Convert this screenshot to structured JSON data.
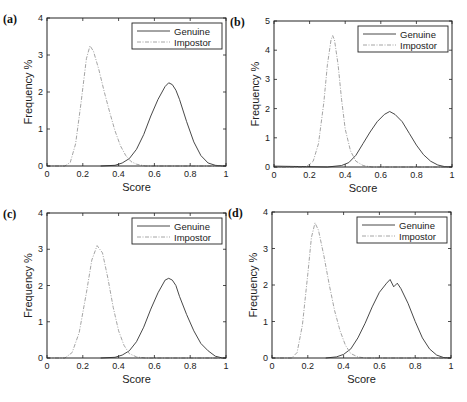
{
  "figure": {
    "shared": {
      "xlabel": "Score",
      "ylabel": "Frequency %",
      "xticks": [
        "0",
        "0.2",
        "0.4",
        "0.6",
        "0.8",
        "1"
      ],
      "legend": [
        "Genuine",
        "Impostor"
      ],
      "colors": {
        "genuine": "#333333",
        "impostor": "#9a9a9a",
        "axis": "#222222"
      }
    }
  },
  "chart_data": [
    {
      "panel": "(a)",
      "type": "line",
      "xlabel": "Score",
      "ylabel": "Frequency %",
      "xlim": [
        0,
        1
      ],
      "ylim": [
        0,
        4
      ],
      "yticks": [
        "0",
        "1",
        "2",
        "3",
        "4"
      ],
      "legend_position": "upper right",
      "series": [
        {
          "name": "Genuine",
          "style": "solid",
          "x": [
            0.3,
            0.38,
            0.42,
            0.46,
            0.5,
            0.54,
            0.58,
            0.62,
            0.66,
            0.68,
            0.7,
            0.72,
            0.74,
            0.78,
            0.82,
            0.86,
            0.9,
            0.94,
            0.98,
            1.0
          ],
          "y": [
            0.0,
            0.02,
            0.08,
            0.2,
            0.45,
            0.85,
            1.35,
            1.8,
            2.15,
            2.25,
            2.2,
            2.05,
            1.8,
            1.2,
            0.65,
            0.28,
            0.08,
            0.02,
            0.0,
            0.0
          ]
        },
        {
          "name": "Impostor",
          "style": "dash-dot",
          "x": [
            0.0,
            0.1,
            0.13,
            0.16,
            0.19,
            0.22,
            0.24,
            0.26,
            0.29,
            0.32,
            0.35,
            0.38,
            0.41,
            0.44,
            0.47,
            0.5,
            0.55,
            0.6,
            1.0
          ],
          "y": [
            0.0,
            0.0,
            0.1,
            0.6,
            1.7,
            2.9,
            3.25,
            3.1,
            2.6,
            2.0,
            1.45,
            0.95,
            0.55,
            0.28,
            0.12,
            0.05,
            0.0,
            0.0,
            0.0
          ]
        }
      ]
    },
    {
      "panel": "(b)",
      "type": "line",
      "xlabel": "Score",
      "ylabel": "Frequency %",
      "xlim": [
        0,
        1
      ],
      "ylim": [
        0,
        5
      ],
      "yticks": [
        "0",
        "1",
        "2",
        "3",
        "4",
        "5"
      ],
      "legend_position": "upper right",
      "series": [
        {
          "name": "Genuine",
          "style": "solid",
          "x": [
            0.0,
            0.3,
            0.38,
            0.42,
            0.46,
            0.5,
            0.54,
            0.58,
            0.62,
            0.65,
            0.68,
            0.72,
            0.76,
            0.8,
            0.84,
            0.88,
            0.92,
            0.96,
            1.0
          ],
          "y": [
            0.03,
            0.0,
            0.05,
            0.15,
            0.4,
            0.8,
            1.2,
            1.55,
            1.8,
            1.9,
            1.8,
            1.55,
            1.15,
            0.75,
            0.42,
            0.2,
            0.07,
            0.01,
            0.0
          ]
        },
        {
          "name": "Impostor",
          "style": "dash-dot",
          "x": [
            0.0,
            0.18,
            0.22,
            0.25,
            0.28,
            0.3,
            0.32,
            0.33,
            0.34,
            0.36,
            0.38,
            0.4,
            0.43,
            0.46,
            0.5,
            0.55,
            1.0
          ],
          "y": [
            0.0,
            0.0,
            0.2,
            0.8,
            2.2,
            3.5,
            4.35,
            4.5,
            4.35,
            3.5,
            2.3,
            1.3,
            0.55,
            0.2,
            0.05,
            0.0,
            0.0
          ]
        }
      ]
    },
    {
      "panel": "(c)",
      "type": "line",
      "xlabel": "Score",
      "ylabel": "Frequency %",
      "xlim": [
        0,
        1
      ],
      "ylim": [
        0,
        4
      ],
      "yticks": [
        "0",
        "1",
        "2",
        "3",
        "4"
      ],
      "legend_position": "upper right",
      "series": [
        {
          "name": "Genuine",
          "style": "solid",
          "x": [
            0.3,
            0.38,
            0.42,
            0.46,
            0.5,
            0.54,
            0.58,
            0.62,
            0.66,
            0.68,
            0.7,
            0.72,
            0.74,
            0.78,
            0.82,
            0.86,
            0.9,
            0.94,
            0.98,
            1.0
          ],
          "y": [
            0.0,
            0.02,
            0.08,
            0.2,
            0.45,
            0.85,
            1.35,
            1.8,
            2.15,
            2.2,
            2.15,
            2.0,
            1.7,
            1.2,
            0.75,
            0.4,
            0.2,
            0.05,
            0.0,
            0.0
          ]
        },
        {
          "name": "Impostor",
          "style": "dash-dot",
          "x": [
            0.0,
            0.1,
            0.14,
            0.18,
            0.22,
            0.25,
            0.28,
            0.31,
            0.34,
            0.37,
            0.4,
            0.43,
            0.46,
            0.5,
            0.55,
            1.0
          ],
          "y": [
            0.0,
            0.0,
            0.15,
            0.7,
            1.8,
            2.7,
            3.1,
            2.9,
            2.2,
            1.4,
            0.75,
            0.35,
            0.12,
            0.03,
            0.0,
            0.0
          ]
        }
      ]
    },
    {
      "panel": "(d)",
      "type": "line",
      "xlabel": "Score",
      "ylabel": "Frequency %",
      "xlim": [
        0,
        1
      ],
      "ylim": [
        0,
        4
      ],
      "yticks": [
        "0",
        "1",
        "2",
        "3",
        "4"
      ],
      "legend_position": "upper right",
      "series": [
        {
          "name": "Genuine",
          "style": "solid",
          "x": [
            0.3,
            0.36,
            0.4,
            0.44,
            0.48,
            0.52,
            0.56,
            0.6,
            0.64,
            0.66,
            0.68,
            0.7,
            0.72,
            0.76,
            0.8,
            0.84,
            0.88,
            0.92,
            0.96,
            1.0
          ],
          "y": [
            0.0,
            0.03,
            0.1,
            0.25,
            0.55,
            0.95,
            1.4,
            1.8,
            2.05,
            2.15,
            1.95,
            2.05,
            1.9,
            1.5,
            1.0,
            0.55,
            0.25,
            0.08,
            0.01,
            0.0
          ]
        },
        {
          "name": "Impostor",
          "style": "dash-dot",
          "x": [
            0.0,
            0.11,
            0.14,
            0.17,
            0.2,
            0.22,
            0.24,
            0.26,
            0.29,
            0.32,
            0.35,
            0.38,
            0.41,
            0.44,
            0.48,
            0.52,
            1.0
          ],
          "y": [
            0.0,
            0.0,
            0.15,
            0.9,
            2.3,
            3.3,
            3.7,
            3.5,
            2.8,
            2.0,
            1.3,
            0.75,
            0.35,
            0.12,
            0.03,
            0.0,
            0.0
          ]
        }
      ]
    }
  ]
}
